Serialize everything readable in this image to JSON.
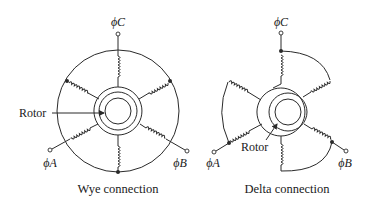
{
  "diagram": {
    "type": "electrical-schematic",
    "panels": [
      {
        "id": "wye",
        "caption": "Wye connection",
        "phase_labels": {
          "a": "ϕA",
          "b": "ϕB",
          "c": "ϕC"
        },
        "rotor_label": "Rotor"
      },
      {
        "id": "delta",
        "caption": "Delta connection",
        "phase_labels": {
          "a": "ϕA",
          "b": "ϕB",
          "c": "ϕC"
        },
        "rotor_label": "Rotor"
      }
    ],
    "colors": {
      "line": "#2a2a2a",
      "text": "#1a1a1a",
      "background": "#ffffff"
    }
  }
}
